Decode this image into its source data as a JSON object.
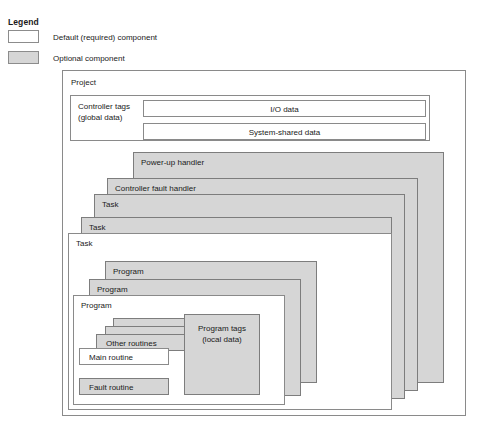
{
  "legend": {
    "title": "Legend",
    "items": [
      {
        "swatch": "default-swatch",
        "label": "Default (required) component"
      },
      {
        "swatch": "optional-swatch",
        "label": "Optional component"
      }
    ]
  },
  "colors": {
    "optional_fill": "#d6d6d6",
    "default_fill": "#ffffff",
    "border": "#8a8a8a",
    "text": "#1a1a1a"
  },
  "diagram": {
    "project": {
      "label": "Project"
    },
    "controller_tags": {
      "label_line1": "Controller tags",
      "label_line2": "(global data)",
      "label": "Controller tags\n(global data)",
      "rows": [
        {
          "label": "I/O data"
        },
        {
          "label": "System-shared data"
        }
      ]
    },
    "task_stack": [
      {
        "label": "Power-up handler",
        "type": "optional"
      },
      {
        "label": "Controller fault handler",
        "type": "optional"
      },
      {
        "label": "Task",
        "type": "optional"
      },
      {
        "label": "Task",
        "type": "optional"
      },
      {
        "label": "Task",
        "type": "default"
      }
    ],
    "program_stack": [
      {
        "label": "Program",
        "type": "optional"
      },
      {
        "label": "Program",
        "type": "optional"
      },
      {
        "label": "Program",
        "type": "default"
      }
    ],
    "routines": [
      {
        "label": "Other routines",
        "type": "optional"
      },
      {
        "label": "Main routine",
        "type": "default"
      },
      {
        "label": "Fault routine",
        "type": "optional"
      }
    ],
    "program_tags": {
      "label_line1": "Program tags",
      "label_line2": "(local data)",
      "label": "Program tags\n(local data)",
      "type": "optional"
    }
  }
}
